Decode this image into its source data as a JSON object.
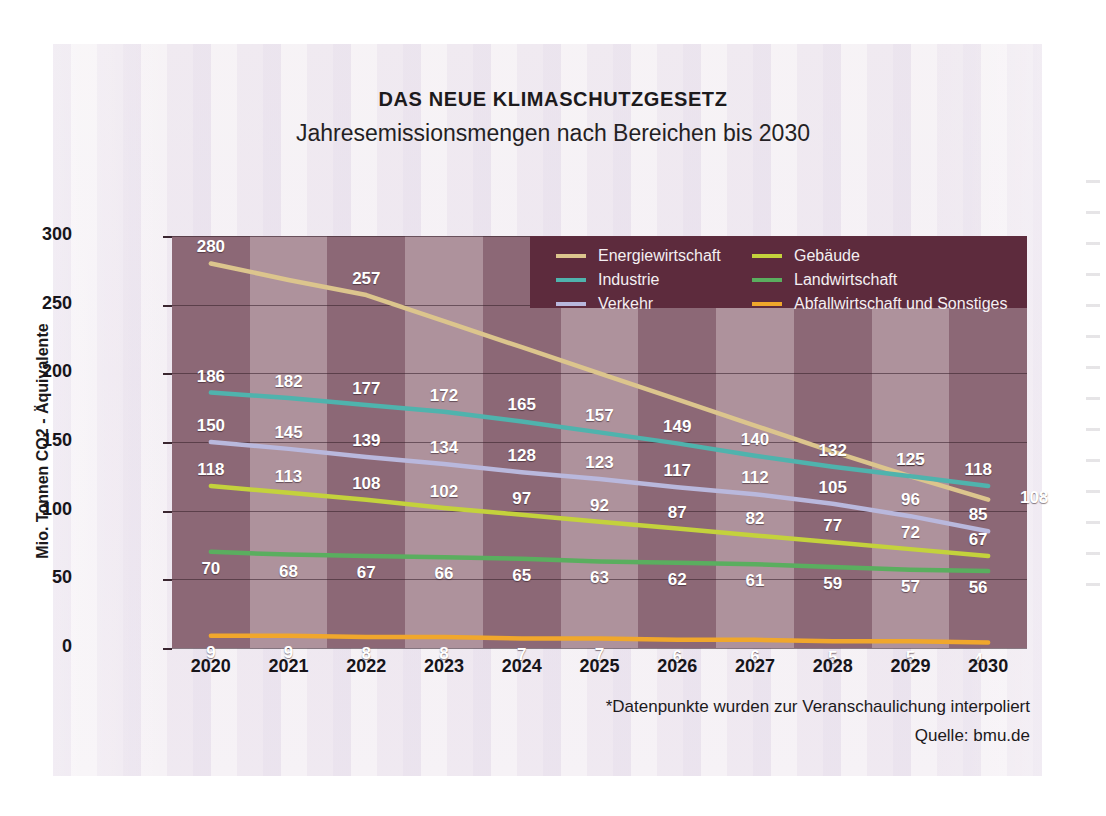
{
  "header": {
    "title": "DAS NEUE KLIMASCHUTZGESETZ",
    "subtitle": "Jahresemissionsmengen nach Bereichen bis 2030"
  },
  "footer": {
    "note": "*Datenpunkte wurden zur Veranschaulichung interpoliert",
    "source": "Quelle: bmu.de"
  },
  "colors": {
    "energiewirtschaft": "#dcc58d",
    "industrie": "#4fb3ad",
    "verkehr": "#b9b8dd",
    "gebaeude": "#c4d23c",
    "landwirtschaft": "#5aae5f",
    "abfallwirtschaft": "#f0a72c",
    "legend_background": "#5d2b3d",
    "plot_band_dark": "#8e6a77",
    "plot_band_light": "#b296a0",
    "page_background": "#f3eef4"
  },
  "chart_data": {
    "type": "line",
    "title": "DAS NEUE KLIMASCHUTZGESETZ",
    "subtitle": "Jahresemissionsmengen nach Bereichen bis 2030",
    "xlabel": "",
    "ylabel": "Mio. Tonnen CO2 - Äquivalente",
    "ylim": [
      0,
      300
    ],
    "yticks": [
      0,
      50,
      100,
      150,
      200,
      250,
      300
    ],
    "ytick_labels": [
      "0",
      "50",
      "100",
      "150",
      "200",
      "250",
      "300"
    ],
    "grid": true,
    "legend_position": "top-right",
    "categories": [
      "2020",
      "2021",
      "2022",
      "2023",
      "2024",
      "2025",
      "2026",
      "2027",
      "2028",
      "2029",
      "2030"
    ],
    "x": [
      2020,
      2021,
      2022,
      2023,
      2024,
      2025,
      2026,
      2027,
      2028,
      2029,
      2030
    ],
    "series": [
      {
        "name": "Energiewirtschaft",
        "color": "#dcc58d",
        "values": [
          280,
          268,
          257,
          238,
          219,
          200,
          181,
          162,
          143,
          125,
          108
        ],
        "labels": [
          "280",
          "",
          "257",
          "",
          "",
          "",
          "",
          "",
          "",
          "125",
          "108"
        ],
        "label_indices": [
          0,
          2,
          9,
          10
        ]
      },
      {
        "name": "Industrie",
        "color": "#4fb3ad",
        "values": [
          186,
          182,
          177,
          172,
          165,
          157,
          149,
          140,
          132,
          125,
          118
        ],
        "labels": [
          "186",
          "182",
          "177",
          "172",
          "165",
          "157",
          "149",
          "140",
          "132",
          "125",
          "118"
        ],
        "label_indices": [
          0,
          1,
          2,
          3,
          4,
          5,
          6,
          7,
          8,
          9,
          10
        ]
      },
      {
        "name": "Verkehr",
        "color": "#b9b8dd",
        "values": [
          150,
          145,
          139,
          134,
          128,
          123,
          117,
          112,
          105,
          96,
          85
        ],
        "labels": [
          "150",
          "145",
          "139",
          "134",
          "128",
          "123",
          "117",
          "112",
          "105",
          "96",
          "85"
        ],
        "label_indices": [
          0,
          1,
          2,
          3,
          4,
          5,
          6,
          7,
          8,
          9,
          10
        ]
      },
      {
        "name": "Gebäude",
        "color": "#c4d23c",
        "values": [
          118,
          113,
          108,
          102,
          97,
          92,
          87,
          82,
          77,
          72,
          67
        ],
        "labels": [
          "118",
          "113",
          "108",
          "102",
          "97",
          "92",
          "87",
          "82",
          "77",
          "72",
          "67"
        ],
        "label_indices": [
          0,
          1,
          2,
          3,
          4,
          5,
          6,
          7,
          8,
          9,
          10
        ]
      },
      {
        "name": "Landwirtschaft",
        "color": "#5aae5f",
        "values": [
          70,
          68,
          67,
          66,
          65,
          63,
          62,
          61,
          59,
          57,
          56
        ],
        "labels": [
          "70",
          "68",
          "67",
          "66",
          "65",
          "63",
          "62",
          "61",
          "59",
          "57",
          "56"
        ],
        "label_indices": [
          0,
          1,
          2,
          3,
          4,
          5,
          6,
          7,
          8,
          9,
          10
        ]
      },
      {
        "name": "Abfallwirtschaft und Sonstiges",
        "color": "#f0a72c",
        "values": [
          9,
          9,
          8,
          8,
          7,
          7,
          6,
          6,
          5,
          5,
          4
        ],
        "labels": [
          "9",
          "9",
          "8",
          "8",
          "7",
          "7",
          "6",
          "6",
          "5",
          "5",
          "4"
        ],
        "label_indices": [
          0,
          1,
          2,
          3,
          4,
          5,
          6,
          7,
          8,
          9,
          10
        ]
      }
    ],
    "annotations": [
      "*Datenpunkte wurden zur Veranschaulichung interpoliert",
      "Quelle: bmu.de"
    ]
  }
}
